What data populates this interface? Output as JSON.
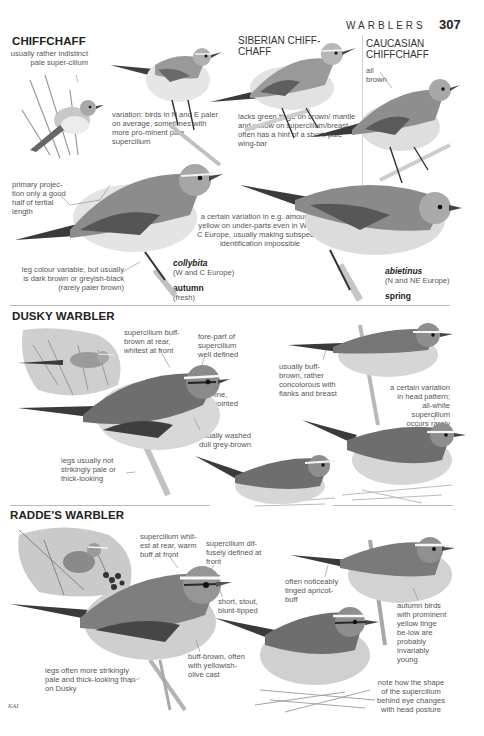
{
  "header": {
    "running_head": "WARBLERS",
    "page_number": "307"
  },
  "chiffchaff": {
    "title": "CHIFFCHAFF",
    "notes": {
      "supercilium": "usually rather indistinct pale super-cilium",
      "variation_ne": "variation: birds in N and E paler on average, sometimes with more pro-minent pale supercilium",
      "primary_projection": "primary projec-tion only a good half of tertial length",
      "legs": "leg colour variable, but usually is dark brown or greyish-black (rarely paler brown)",
      "yellow_variation": "a certain variation in e.g. amount of yellow on under-parts even in W and C Europe, usually making subspecific identification impossible"
    },
    "collybita": {
      "name": "collybita",
      "range": "(W and C Europe)",
      "season": "autumn",
      "season_note": "(fresh)"
    },
    "abietinus": {
      "name": "abietinus",
      "range": "(N and NE Europe)",
      "season": "spring"
    }
  },
  "siberian_chiffchaff": {
    "title": "SIBERIAN CHIFF-CHAFF",
    "note": "lacks green tinge on crown/ mantle and yellow on supercilium/breast, often has a hint of a short, pale wing-bar"
  },
  "caucasian_chiffchaff": {
    "title": "CAUCASIAN CHIFFCHAFF",
    "note": "all brown"
  },
  "dusky_warbler": {
    "title": "DUSKY WARBLER",
    "notes": {
      "supercilium_rear": "supercilium buff-brown at rear, whitest at front",
      "forepart": "fore-part of supercilium well defined",
      "bill": "fine, pointed",
      "underparts": "usually washed dull grey-brown",
      "legs": "legs usually not strikingly pale or thick-looking",
      "flanks": "usually buff-brown, rather concolorous with flanks and breast",
      "head_pattern": "a certain variation in head pattern; all-white supercilium occurs rarely"
    }
  },
  "raddes_warbler": {
    "title": "RADDE'S WARBLER",
    "notes": {
      "supercilium_rear": "supercilium whit-est at rear, warm buff at front",
      "supercilium_front": "supercilium dif-fusely defined at front",
      "bill": "short, stout, blunt-tipped",
      "underparts": "buff-brown, often with yellowish-olive cast",
      "legs": "legs often more strikingly pale and thick-looking than on Dusky",
      "apricot": "often noticeably tinged apricot-buff",
      "autumn": "autumn birds with prominent yellow tinge be-low are probably invariably young",
      "posture": "note how the shape of the supercilium behind eye changes with head posture"
    }
  },
  "credit": "KAI",
  "colors": {
    "page": "#ffffff",
    "text": "#3a3a3a",
    "rule": "#b8b8b8",
    "bird_dark": "#5a5a5a",
    "bird_mid": "#8a8a8a",
    "bird_light": "#dadada"
  }
}
